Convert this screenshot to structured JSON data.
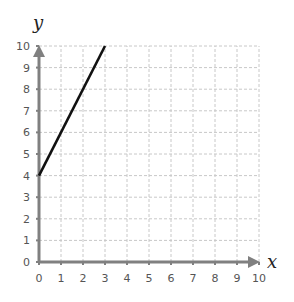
{
  "chart_data": {
    "type": "line",
    "title": "",
    "xlabel": "x",
    "ylabel": "y",
    "xlim": [
      0,
      10
    ],
    "ylim": [
      0,
      10
    ],
    "x_ticks": [
      0,
      1,
      2,
      3,
      4,
      5,
      6,
      7,
      8,
      9,
      10
    ],
    "y_ticks": [
      0,
      1,
      2,
      3,
      4,
      5,
      6,
      7,
      8,
      9,
      10
    ],
    "grid": true,
    "series": [
      {
        "name": "y = 2x + 4",
        "x": [
          0,
          3
        ],
        "y": [
          4,
          10
        ],
        "color": "#111111"
      }
    ],
    "colors": {
      "axis": "#808080",
      "grid": "#c8c8c8",
      "text": "#555555"
    }
  }
}
